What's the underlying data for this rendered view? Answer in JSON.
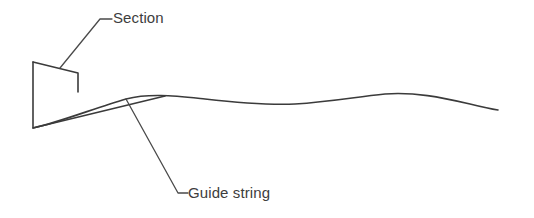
{
  "diagram": {
    "background_color": "#ffffff",
    "line_color": "#3b3b3b",
    "leader_color": "#4a4a4a",
    "width": 534,
    "height": 218,
    "labels": {
      "section": "Section",
      "guide_string": "Guide string"
    },
    "shapes": {
      "section_profile": {
        "name": "section-profile",
        "description": "Open quadrilateral profile outline at left",
        "points": "33,62 78,73 78,92",
        "points_lower": "33,62 33,128 165,96"
      },
      "guide_string_curve": {
        "name": "guide-string-curve",
        "description": "Wavy longitudinal guide string running left to right",
        "path": "M 33,128 C 60,122 95,108 126,99 C 150,93 175,96 205,99 C 240,103 268,105 295,104 C 330,102 355,97 385,94 C 415,92 440,97 470,104 C 482,107 491,109 498,110"
      }
    },
    "leaders": {
      "section_leader": {
        "name": "section-leader-line",
        "path": "M 60,68 L 100,19 L 112,19"
      },
      "guide_string_leader": {
        "name": "guide-string-leader-line",
        "path": "M 126,99 L 178,193 L 188,193"
      }
    }
  }
}
